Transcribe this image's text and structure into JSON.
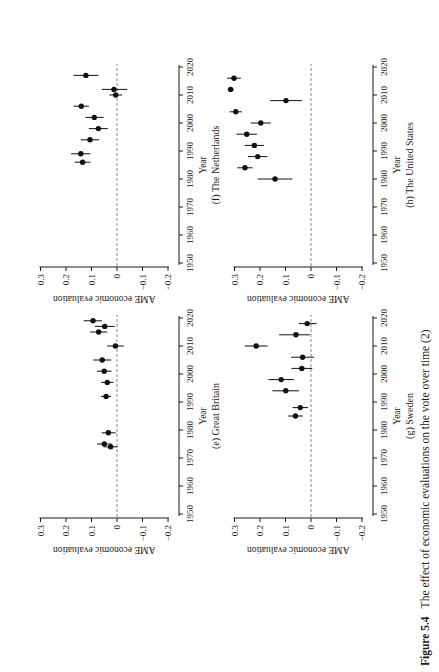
{
  "caption": {
    "label": "Figure 5.4",
    "text": "The effect of economic evaluations on the vote over time (2)"
  },
  "axis": {
    "ytick_labels": [
      "0.3",
      "0.2",
      "0.1",
      "0",
      "−0.1",
      "−0.2"
    ],
    "ytick_values": [
      0.3,
      0.2,
      0.1,
      0,
      -0.1,
      -0.2
    ],
    "xtick_values": [
      1950,
      1960,
      1970,
      1980,
      1990,
      2000,
      2010,
      2020
    ]
  },
  "chart_data": [
    {
      "type": "scatter",
      "id": "e",
      "panel_label": "(e) Great Britain",
      "xlabel": "Year",
      "ylabel": "AME economic evaluation",
      "xlim": [
        1950,
        2020
      ],
      "ylim": [
        -0.2,
        0.3
      ],
      "grid": false,
      "zero_line": true,
      "points": [
        {
          "year": 1974,
          "ame": 0.025,
          "lo": -0.003,
          "hi": 0.053
        },
        {
          "year": 1975,
          "ame": 0.05,
          "lo": 0.022,
          "hi": 0.078
        },
        {
          "year": 1979,
          "ame": 0.034,
          "lo": 0.005,
          "hi": 0.06
        },
        {
          "year": 1992,
          "ame": 0.043,
          "lo": 0.023,
          "hi": 0.063
        },
        {
          "year": 1997,
          "ame": 0.038,
          "lo": 0.014,
          "hi": 0.062
        },
        {
          "year": 2001,
          "ame": 0.05,
          "lo": 0.021,
          "hi": 0.079
        },
        {
          "year": 2005,
          "ame": 0.058,
          "lo": 0.023,
          "hi": 0.093
        },
        {
          "year": 2010,
          "ame": 0.006,
          "lo": -0.027,
          "hi": 0.039
        },
        {
          "year": 2015,
          "ame": 0.072,
          "lo": 0.038,
          "hi": 0.105
        },
        {
          "year": 2017,
          "ame": 0.048,
          "lo": 0.009,
          "hi": 0.087
        },
        {
          "year": 2019,
          "ame": 0.094,
          "lo": 0.059,
          "hi": 0.131
        }
      ]
    },
    {
      "type": "scatter",
      "id": "f",
      "panel_label": "(f) The Netherlands",
      "xlabel": "Year",
      "ylabel": "AME economic evaluation",
      "xlim": [
        1950,
        2020
      ],
      "ylim": [
        -0.2,
        0.3
      ],
      "grid": false,
      "zero_line": true,
      "points": [
        {
          "year": 1986,
          "ame": 0.135,
          "lo": 0.104,
          "hi": 0.166
        },
        {
          "year": 1989,
          "ame": 0.142,
          "lo": 0.104,
          "hi": 0.18
        },
        {
          "year": 1994,
          "ame": 0.106,
          "lo": 0.07,
          "hi": 0.142
        },
        {
          "year": 1998,
          "ame": 0.073,
          "lo": 0.036,
          "hi": 0.11
        },
        {
          "year": 2002,
          "ame": 0.089,
          "lo": 0.052,
          "hi": 0.124
        },
        {
          "year": 2006,
          "ame": 0.14,
          "lo": 0.11,
          "hi": 0.17
        },
        {
          "year": 2010,
          "ame": 0.005,
          "lo": -0.02,
          "hi": 0.03
        },
        {
          "year": 2012,
          "ame": 0.012,
          "lo": -0.04,
          "hi": 0.06
        },
        {
          "year": 2017,
          "ame": 0.122,
          "lo": 0.073,
          "hi": 0.171
        }
      ]
    },
    {
      "type": "scatter",
      "id": "g",
      "panel_label": "(g) Sweden",
      "xlabel": "Year",
      "ylabel": "AME economic evaluation",
      "xlim": [
        1950,
        2020
      ],
      "ylim": [
        -0.2,
        0.3
      ],
      "grid": false,
      "zero_line": true,
      "points": [
        {
          "year": 1985,
          "ame": 0.061,
          "lo": 0.032,
          "hi": 0.09
        },
        {
          "year": 1988,
          "ame": 0.042,
          "lo": 0.012,
          "hi": 0.072
        },
        {
          "year": 1994,
          "ame": 0.099,
          "lo": 0.047,
          "hi": 0.151
        },
        {
          "year": 1998,
          "ame": 0.117,
          "lo": 0.067,
          "hi": 0.167
        },
        {
          "year": 2002,
          "ame": 0.036,
          "lo": -0.005,
          "hi": 0.077
        },
        {
          "year": 2006,
          "ame": 0.033,
          "lo": -0.012,
          "hi": 0.078
        },
        {
          "year": 2010,
          "ame": 0.215,
          "lo": 0.17,
          "hi": 0.26
        },
        {
          "year": 2014,
          "ame": 0.059,
          "lo": 0.005,
          "hi": 0.125
        },
        {
          "year": 2018,
          "ame": 0.015,
          "lo": -0.022,
          "hi": 0.048
        }
      ]
    },
    {
      "type": "scatter",
      "id": "h",
      "panel_label": "(h) The United States",
      "xlabel": "Year",
      "ylabel": "AME economic evaluation",
      "xlim": [
        1950,
        2020
      ],
      "ylim": [
        -0.2,
        0.3
      ],
      "grid": false,
      "zero_line": true,
      "points": [
        {
          "year": 1980,
          "ame": 0.141,
          "lo": 0.073,
          "hi": 0.209
        },
        {
          "year": 1984,
          "ame": 0.259,
          "lo": 0.229,
          "hi": 0.289
        },
        {
          "year": 1988,
          "ame": 0.209,
          "lo": 0.171,
          "hi": 0.247
        },
        {
          "year": 1992,
          "ame": 0.222,
          "lo": 0.184,
          "hi": 0.26
        },
        {
          "year": 1996,
          "ame": 0.252,
          "lo": 0.212,
          "hi": 0.292
        },
        {
          "year": 2000,
          "ame": 0.197,
          "lo": 0.158,
          "hi": 0.236
        },
        {
          "year": 2004,
          "ame": 0.295,
          "lo": 0.271,
          "hi": 0.319
        },
        {
          "year": 2008,
          "ame": 0.098,
          "lo": 0.036,
          "hi": 0.16
        },
        {
          "year": 2012,
          "ame": 0.315,
          "lo": 0.303,
          "hi": 0.327
        },
        {
          "year": 2016,
          "ame": 0.302,
          "lo": 0.275,
          "hi": 0.329
        }
      ]
    }
  ]
}
